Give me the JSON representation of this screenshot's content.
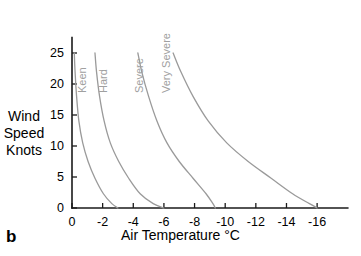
{
  "panel": {
    "label": "b"
  },
  "chart_data": {
    "type": "line",
    "title": "",
    "xlabel": "Air Temperature °C",
    "ylabel": "Wind Speed Knots",
    "ylabel_lines": [
      "Wind",
      "Speed",
      "Knots"
    ],
    "xlim": [
      0,
      -18
    ],
    "ylim": [
      0,
      27.5
    ],
    "xticks": [
      0,
      -2,
      -4,
      -6,
      -8,
      -10,
      -12,
      -14,
      -16
    ],
    "xtick_labels": [
      "0",
      "-2",
      "-4",
      "-6",
      "-8",
      "-10",
      "-12",
      "-14",
      "-16"
    ],
    "yticks": [
      0,
      5,
      10,
      15,
      20,
      25
    ],
    "ytick_labels": [
      "0",
      "5",
      "10",
      "15",
      "20",
      "25"
    ],
    "grid": false,
    "legend": "inline-curve-labels",
    "curve_color": "#9a9a9a",
    "axis_color": "#1a1a1a",
    "label_color": "#a0a0a0",
    "series": [
      {
        "name": "Keen",
        "label": "Keen",
        "x": [
          -0.15,
          -0.2,
          -0.3,
          -0.45,
          -0.7,
          -1.05,
          -1.5,
          -2.05,
          -2.6,
          -3.0
        ],
        "y": [
          25.0,
          22.0,
          18.0,
          14.0,
          10.5,
          7.5,
          4.8,
          2.3,
          0.7,
          0.0
        ]
      },
      {
        "name": "Hard",
        "label": "Hard",
        "x": [
          -1.5,
          -1.6,
          -1.8,
          -2.1,
          -2.5,
          -3.05,
          -3.7,
          -4.45,
          -5.3,
          -6.0
        ],
        "y": [
          25.0,
          22.0,
          18.0,
          14.0,
          10.5,
          7.5,
          4.8,
          2.3,
          0.7,
          0.0
        ]
      },
      {
        "name": "Severe",
        "label": "Severe",
        "x": [
          -4.3,
          -4.55,
          -5.0,
          -5.55,
          -6.2,
          -7.0,
          -7.9,
          -8.75,
          -9.2,
          -9.35
        ],
        "y": [
          25.0,
          22.0,
          18.0,
          14.0,
          10.5,
          7.5,
          4.8,
          2.3,
          0.7,
          0.0
        ]
      },
      {
        "name": "Very Severe",
        "label": "Very Severe",
        "x": [
          -6.6,
          -7.1,
          -7.9,
          -8.9,
          -10.1,
          -11.5,
          -13.0,
          -14.4,
          -15.5,
          -16.0
        ],
        "y": [
          25.0,
          22.0,
          18.0,
          14.0,
          10.5,
          7.5,
          4.8,
          2.3,
          0.7,
          0.0
        ]
      }
    ]
  }
}
